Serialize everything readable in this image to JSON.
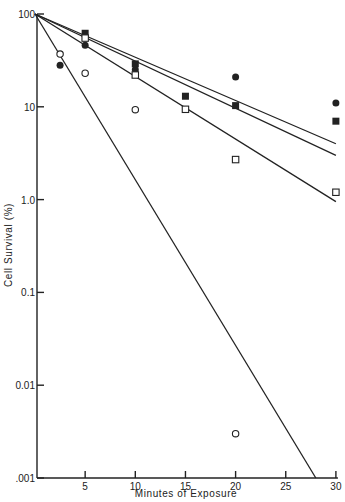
{
  "chart_data": {
    "type": "scatter",
    "title": "",
    "xlabel": "Minutes of Exposure",
    "ylabel": "Cell Survival (%)",
    "xlim": [
      0,
      30
    ],
    "ylim": [
      0.001,
      100
    ],
    "yscale": "log",
    "grid": false,
    "legend": null,
    "x_ticks": [
      5,
      10,
      15,
      20,
      25,
      30
    ],
    "x_tick_labels": [
      "5",
      "10",
      "15",
      "20",
      "25",
      "30"
    ],
    "y_ticks": [
      100,
      10,
      1,
      0.1,
      0.01,
      0.001
    ],
    "y_tick_labels": [
      "100",
      "10",
      "1.0",
      "0.1",
      "0.01",
      ".001"
    ],
    "series": [
      {
        "name": "filled-circle",
        "marker": "filled-circle",
        "x": [
          2.5,
          5,
          10,
          20,
          30
        ],
        "y": [
          28,
          46,
          25,
          21,
          11
        ]
      },
      {
        "name": "filled-square",
        "marker": "filled-square",
        "x": [
          5,
          10,
          15,
          20,
          30
        ],
        "y": [
          62,
          29,
          13,
          10.3,
          7
        ]
      },
      {
        "name": "open-square",
        "marker": "open-square",
        "x": [
          5,
          10,
          15,
          20,
          30
        ],
        "y": [
          55,
          22,
          9.4,
          2.7,
          1.2
        ]
      },
      {
        "name": "open-circle",
        "marker": "open-circle",
        "x": [
          2.5,
          5,
          10,
          20
        ],
        "y": [
          37,
          23,
          9.3,
          0.003
        ]
      }
    ],
    "fit_lines": [
      {
        "name": "line-1",
        "x": [
          0,
          30
        ],
        "y": [
          100,
          4.0
        ]
      },
      {
        "name": "line-2",
        "x": [
          0,
          30
        ],
        "y": [
          100,
          3.0
        ]
      },
      {
        "name": "line-3",
        "x": [
          0,
          30
        ],
        "y": [
          100,
          0.95
        ]
      },
      {
        "name": "line-4",
        "x": [
          0,
          28
        ],
        "y": [
          100,
          0.001
        ]
      }
    ]
  },
  "colors": {
    "ink": "#222222",
    "background": "#ffffff"
  }
}
